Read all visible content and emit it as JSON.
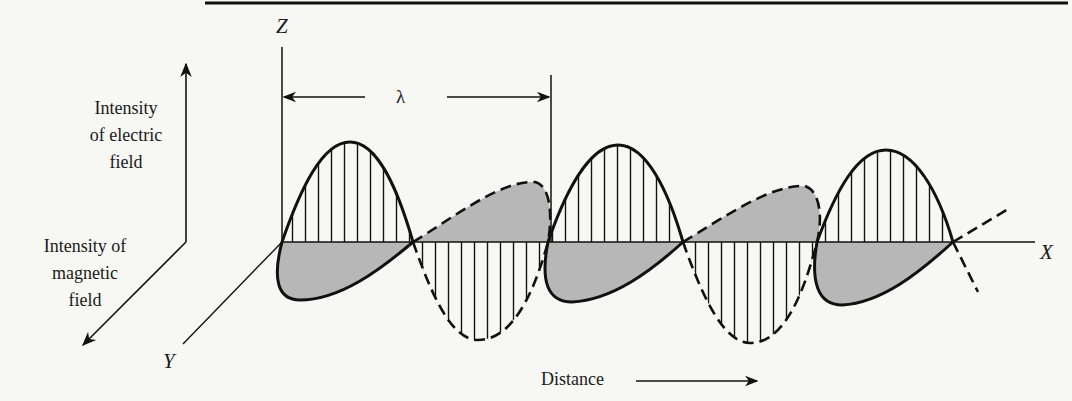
{
  "figure": {
    "labels": {
      "electric_axis": [
        "Intensity",
        "of electric",
        "field"
      ],
      "magnetic_axis": [
        "Intensity of",
        "magnetic",
        "field"
      ],
      "z_axis": "Z",
      "x_axis": "X",
      "y_axis": "Y",
      "wavelength": "λ",
      "distance": "Distance"
    },
    "colors": {
      "ink": "#111111",
      "fill_gray": "#b7b7b7",
      "background": "#f7f7f4"
    }
  }
}
